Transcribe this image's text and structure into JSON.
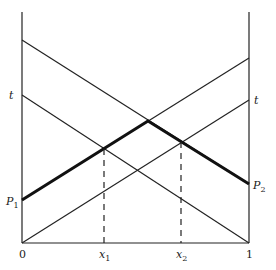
{
  "diagram": {
    "type": "line-diagram",
    "axes": {
      "left_axis_label_bottom": "0",
      "right_axis_label_bottom": "1",
      "left_axis_x": 22,
      "right_axis_x": 249,
      "top_y": 12,
      "baseline_y": 243
    },
    "labels": {
      "t_left": "t",
      "t_right": "t",
      "p1_main": "P",
      "p1_sub": "1",
      "p2_main": "P",
      "p2_sub": "2",
      "x1_main": "x",
      "x1_sub": "1",
      "x2_main": "x",
      "x2_sub": "2",
      "zero": "0",
      "one": "1"
    },
    "lines": [
      {
        "name": "upper-descending-line",
        "from": [
          22,
          40
        ],
        "to": [
          249,
          184
        ],
        "style": "thin"
      },
      {
        "name": "t-descending-line",
        "from": [
          22,
          95
        ],
        "to": [
          249,
          243
        ],
        "style": "thin"
      },
      {
        "name": "p1-ascending-line",
        "from": [
          22,
          200
        ],
        "to": [
          249,
          58
        ],
        "style": "thin"
      },
      {
        "name": "t-ascending-line",
        "from": [
          22,
          243
        ],
        "to": [
          249,
          100
        ],
        "style": "thin"
      }
    ],
    "bold_path": {
      "points": [
        [
          22,
          200
        ],
        [
          148,
          121
        ],
        [
          249,
          184
        ]
      ]
    },
    "dashed_lines": [
      {
        "name": "x1-dashed",
        "x": 104,
        "from_y": 149,
        "to_y": 243
      },
      {
        "name": "x2-dashed",
        "x": 181,
        "from_y": 142,
        "to_y": 243
      }
    ]
  }
}
